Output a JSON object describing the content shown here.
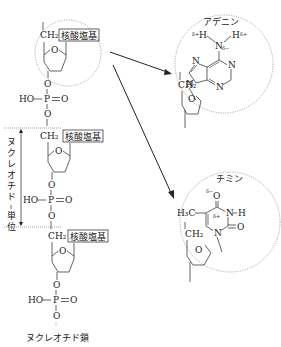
{
  "diagram": {
    "chain": {
      "caption": "ヌクレオチド鎖",
      "units": [
        {
          "ch2": "CH₂",
          "base_box": "核酸塩基",
          "ring_o": "O"
        },
        {
          "ch2": "CH₂",
          "base_box": "核酸塩基",
          "ring_o": "O"
        },
        {
          "ch2": "CH₂",
          "base_box": "核酸塩基",
          "ring_o": "O"
        }
      ],
      "phosphate": {
        "ho": "HO",
        "p": "P",
        "o_double": "O",
        "o_link": "O"
      },
      "unit_bracket_label": "ヌクレオチド一単位"
    },
    "adenine": {
      "title": "アデニン",
      "h_left": "H",
      "h_right": "H",
      "n_amine": "N",
      "delta_plus": "δ+",
      "delta_minus": "δ−",
      "ring_atoms": [
        "N",
        "N",
        "N",
        "N",
        "N"
      ],
      "ch2": "CH₂",
      "ring_o": "O"
    },
    "thymine": {
      "title": "チミン",
      "o_top": "O",
      "delta_minus": "δ−",
      "delta_plus": "δ+",
      "nh": "N",
      "h": "H",
      "o_right": "O",
      "n_bottom": "N",
      "methyl": "H₃C",
      "ch2": "CH₂",
      "ring_o": "O"
    }
  }
}
